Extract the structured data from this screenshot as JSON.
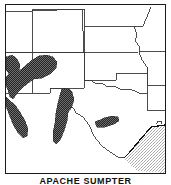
{
  "figure": {
    "caption": "APACHE SUMPTER",
    "kind": "distribution-range-map",
    "region": "Southwestern United States"
  },
  "map": {
    "frame": {
      "border_color": "#1a1a1a",
      "background_color": "#ffffff",
      "width": 161,
      "height": 170
    },
    "state_boundary_color": "#3a3a3a",
    "coastline_color": "#111111",
    "legend_implicit": {
      "range_fill_label": "species range (dark stipple)",
      "water_fill_label": "Gulf of Mexico (light stipple)"
    },
    "fills": {
      "range_dark": "#4a4a4a",
      "range_dark_dither": "#2b2b2b",
      "water_light": "#d6d6d6",
      "water_light_dither": "#bfbfbf",
      "land": "#ffffff"
    },
    "states": [
      {
        "name": "Utah",
        "position": "top-left"
      },
      {
        "name": "Colorado",
        "position": "top-center-left"
      },
      {
        "name": "Wyoming",
        "position": "top-center"
      },
      {
        "name": "Nebraska",
        "position": "top-right"
      },
      {
        "name": "Iowa",
        "position": "top-far-right"
      },
      {
        "name": "Kansas",
        "position": "center-right"
      },
      {
        "name": "Missouri",
        "position": "right"
      },
      {
        "name": "Arizona",
        "position": "left"
      },
      {
        "name": "New Mexico",
        "position": "center-left"
      },
      {
        "name": "Oklahoma",
        "position": "center"
      },
      {
        "name": "Arkansas",
        "position": "right-lower"
      },
      {
        "name": "Texas",
        "position": "bottom-center"
      },
      {
        "name": "Louisiana",
        "position": "bottom-right"
      }
    ],
    "range_patches": [
      {
        "id": "arizona-western-lobe",
        "label": "western Arizona range lobe"
      },
      {
        "id": "arizona-central-band",
        "label": "central Arizona diagonal band"
      },
      {
        "id": "arizona-southwest-tail",
        "label": "southwestern Arizona tail"
      },
      {
        "id": "new-mexico-central",
        "label": "central New Mexico vertical range"
      },
      {
        "id": "texas-edwards-plateau",
        "label": "central Texas elongated range"
      }
    ],
    "water_bodies": [
      {
        "id": "gulf-of-mexico",
        "label": "Gulf of Mexico"
      }
    ]
  }
}
